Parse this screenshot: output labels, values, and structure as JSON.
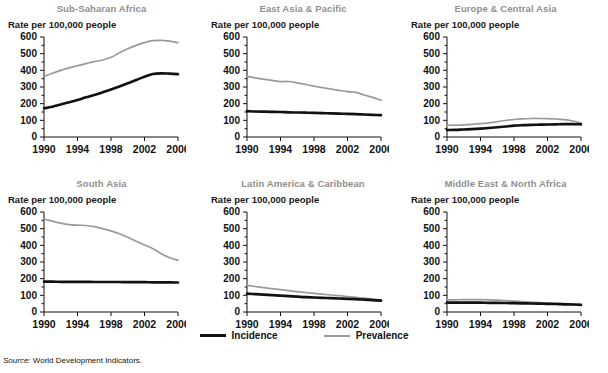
{
  "figure": {
    "source_prefix": "Source:",
    "source_text": "World Development Indicators.",
    "y_axis_label": "Rate per 100,000 people",
    "legend": [
      {
        "label": "Incidence",
        "color": "#111111"
      },
      {
        "label": "Prevalence",
        "color": "#9a9a9a"
      }
    ]
  },
  "chart_data": {
    "type": "line",
    "title": "",
    "xlabel": "",
    "ylabel": "Rate per 100,000 people",
    "xlim": [
      1990,
      2006
    ],
    "ylim": [
      0,
      600
    ],
    "yticks": [
      0,
      100,
      200,
      300,
      400,
      500,
      600
    ],
    "xticks": [
      1990,
      1994,
      1998,
      2002,
      2006
    ],
    "x": [
      1990,
      1991,
      1992,
      1993,
      1994,
      1995,
      1996,
      1997,
      1998,
      1999,
      2000,
      2001,
      2002,
      2003,
      2004,
      2005,
      2006
    ],
    "grid": false,
    "legend_position": "bottom-center",
    "legend_entries": [
      "Incidence",
      "Prevalence"
    ],
    "panels": [
      {
        "title": "Sub-Saharan Africa",
        "series": [
          {
            "name": "Incidence",
            "color": "#111111",
            "values": [
              172,
              182,
              195,
              208,
              222,
              238,
              252,
              268,
              285,
              303,
              322,
              342,
              362,
              378,
              382,
              380,
              377
            ]
          },
          {
            "name": "Prevalence",
            "color": "#9a9a9a",
            "values": [
              362,
              382,
              400,
              415,
              428,
              440,
              452,
              462,
              478,
              505,
              530,
              550,
              566,
              578,
              580,
              575,
              566
            ]
          }
        ]
      },
      {
        "title": "East Asia & Pacific",
        "series": [
          {
            "name": "Incidence",
            "color": "#111111",
            "values": [
              155,
              153,
              152,
              151,
              150,
              148,
              147,
              146,
              145,
              143,
              142,
              140,
              139,
              137,
              135,
              133,
              131
            ]
          },
          {
            "name": "Prevalence",
            "color": "#9a9a9a",
            "values": [
              364,
              355,
              347,
              340,
              332,
              333,
              325,
              315,
              305,
              296,
              288,
              280,
              272,
              268,
              252,
              238,
              221
            ]
          }
        ]
      },
      {
        "title": "Europe & Central Asia",
        "series": [
          {
            "name": "Incidence",
            "color": "#111111",
            "values": [
              42,
              43,
              45,
              47,
              50,
              54,
              58,
              63,
              68,
              71,
              73,
              74,
              75,
              76,
              77,
              77,
              76
            ]
          },
          {
            "name": "Prevalence",
            "color": "#9a9a9a",
            "values": [
              70,
              71,
              73,
              76,
              80,
              85,
              92,
              99,
              105,
              109,
              111,
              111,
              110,
              108,
              104,
              96,
              84
            ]
          }
        ]
      },
      {
        "title": "South Asia",
        "series": [
          {
            "name": "Incidence",
            "color": "#111111",
            "values": [
              182,
              182,
              181,
              181,
              181,
              181,
              180,
              180,
              180,
              180,
              179,
              179,
              179,
              178,
              178,
              178,
              177
            ]
          },
          {
            "name": "Prevalence",
            "color": "#9a9a9a",
            "values": [
              558,
              545,
              533,
              524,
              521,
              519,
              512,
              500,
              487,
              470,
              448,
              425,
              402,
              380,
              350,
              326,
              310
            ]
          }
        ]
      },
      {
        "title": "Latin America & Caribbean",
        "series": [
          {
            "name": "Incidence",
            "color": "#111111",
            "values": [
              110,
              107,
              104,
              101,
              98,
              95,
              92,
              89,
              87,
              85,
              83,
              81,
              79,
              77,
              74,
              71,
              68
            ]
          },
          {
            "name": "Prevalence",
            "color": "#9a9a9a",
            "values": [
              160,
              153,
              146,
              140,
              134,
              128,
              122,
              117,
              112,
              107,
              102,
              98,
              93,
              88,
              83,
              78,
              72
            ]
          }
        ]
      },
      {
        "title": "Middle East & North Africa",
        "series": [
          {
            "name": "Incidence",
            "color": "#111111",
            "values": [
              56,
              56,
              56,
              56,
              56,
              55,
              55,
              54,
              53,
              52,
              51,
              50,
              49,
              48,
              46,
              45,
              43
            ]
          },
          {
            "name": "Prevalence",
            "color": "#9a9a9a",
            "values": [
              72,
              73,
              74,
              74,
              74,
              73,
              71,
              68,
              65,
              62,
              59,
              56,
              54,
              52,
              50,
              47,
              45
            ]
          }
        ]
      }
    ]
  }
}
